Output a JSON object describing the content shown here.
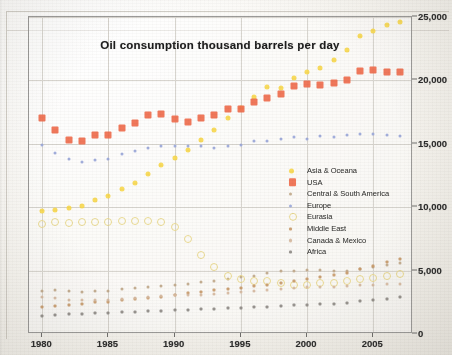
{
  "chart_data": {
    "type": "scatter",
    "title": "Oil consumption thousand barrels per day",
    "xlabel": "",
    "ylabel": "",
    "xlim": [
      1979,
      2008
    ],
    "ylim": [
      0,
      25000
    ],
    "xticks": [
      "1980",
      "1985",
      "1990",
      "1995",
      "2000",
      "2005"
    ],
    "xtick_values": [
      1980,
      1985,
      1990,
      1995,
      2000,
      2005
    ],
    "yticks": [
      "0",
      "5,000",
      "10,000",
      "15,000",
      "20,000",
      "25,000"
    ],
    "ytick_values": [
      0,
      5000,
      10000,
      15000,
      20000,
      25000
    ],
    "grid": true,
    "legend_position": "center-right",
    "x": [
      1980,
      1981,
      1982,
      1983,
      1984,
      1985,
      1986,
      1987,
      1988,
      1989,
      1990,
      1991,
      1992,
      1993,
      1994,
      1995,
      1996,
      1997,
      1998,
      1999,
      2000,
      2001,
      2002,
      2003,
      2004,
      2005,
      2006,
      2007
    ],
    "series": [
      {
        "name": "Asia & Oceana",
        "color": "#f7d84f",
        "marker": "circle",
        "size": 5,
        "values": [
          9700,
          9800,
          9900,
          10100,
          10600,
          10900,
          11400,
          11900,
          12600,
          13300,
          13900,
          14500,
          15300,
          16100,
          17000,
          17800,
          18700,
          19500,
          19400,
          20200,
          20700,
          21000,
          21600,
          22400,
          23500,
          23900,
          24400,
          24600
        ]
      },
      {
        "name": "USA",
        "color": "#ef6c4d",
        "marker": "square",
        "size": 7,
        "values": [
          17060,
          16060,
          15300,
          15230,
          15730,
          15730,
          16280,
          16670,
          17280,
          17320,
          16990,
          16710,
          17030,
          17240,
          17720,
          17720,
          18310,
          18620,
          18920,
          19520,
          19700,
          19650,
          19760,
          20030,
          20730,
          20800,
          20690,
          20680
        ]
      },
      {
        "name": "Central & South America",
        "color": "#c0a88a",
        "marker": "circle",
        "size": 3,
        "values": [
          3400,
          3450,
          3400,
          3350,
          3400,
          3420,
          3560,
          3650,
          3740,
          3800,
          3860,
          3960,
          4100,
          4200,
          4330,
          4460,
          4600,
          4800,
          4960,
          4980,
          5010,
          5070,
          4980,
          4980,
          5120,
          5290,
          5450,
          5600
        ]
      },
      {
        "name": "Europe",
        "color": "#9aa7d9",
        "marker": "circle",
        "size": 3,
        "values": [
          14900,
          14250,
          13800,
          13600,
          13700,
          13800,
          14200,
          14400,
          14700,
          14850,
          14800,
          14800,
          14800,
          14700,
          14800,
          14900,
          15200,
          15200,
          15400,
          15500,
          15400,
          15600,
          15500,
          15700,
          15800,
          15800,
          15700,
          15600
        ]
      },
      {
        "name": "Eurasia",
        "color": "#e8d78a",
        "marker": "circle-open",
        "size": 6,
        "values": [
          8700,
          8800,
          8750,
          8800,
          8850,
          8800,
          8900,
          8950,
          8900,
          8800,
          8400,
          7500,
          6200,
          5300,
          4600,
          4300,
          4200,
          4150,
          4000,
          3900,
          3900,
          4000,
          4050,
          4150,
          4300,
          4400,
          4550,
          4700
        ]
      },
      {
        "name": "Middle East",
        "color": "#c89a6a",
        "marker": "square",
        "size": 3,
        "values": [
          2100,
          2200,
          2300,
          2400,
          2500,
          2550,
          2650,
          2750,
          2850,
          2950,
          3050,
          3200,
          3350,
          3450,
          3550,
          3650,
          3750,
          3900,
          4050,
          4200,
          4350,
          4500,
          4650,
          4800,
          5100,
          5400,
          5650,
          5900
        ]
      },
      {
        "name": "Canada & Mexico",
        "color": "#d6b9a0",
        "marker": "circle",
        "size": 3,
        "values": [
          2900,
          2800,
          2700,
          2650,
          2700,
          2720,
          2780,
          2850,
          2950,
          3000,
          3050,
          3050,
          3100,
          3150,
          3250,
          3300,
          3400,
          3500,
          3550,
          3600,
          3700,
          3700,
          3700,
          3750,
          3850,
          3900,
          3950,
          3950
        ]
      },
      {
        "name": "Africa",
        "color": "#8e8a86",
        "marker": "square",
        "size": 3,
        "values": [
          1450,
          1500,
          1550,
          1600,
          1650,
          1680,
          1720,
          1750,
          1800,
          1830,
          1870,
          1900,
          1950,
          1980,
          2020,
          2060,
          2100,
          2150,
          2200,
          2250,
          2300,
          2350,
          2400,
          2480,
          2580,
          2680,
          2780,
          2880
        ]
      }
    ]
  },
  "legend": {
    "items": [
      {
        "label": "Asia & Oceana"
      },
      {
        "label": "USA"
      },
      {
        "label": "Central & South America"
      },
      {
        "label": "Europe"
      },
      {
        "label": "Eurasia"
      },
      {
        "label": "Middle East"
      },
      {
        "label": "Canada & Mexico"
      },
      {
        "label": "Africa"
      }
    ]
  }
}
